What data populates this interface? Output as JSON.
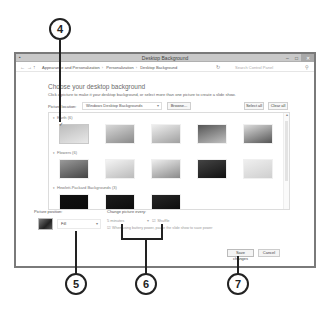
{
  "window": {
    "title": "Desktop Background",
    "controls": [
      "minimize",
      "maximize",
      "close"
    ]
  },
  "nav": {
    "back": "←",
    "forward": "→",
    "up": "↑",
    "breadcrumbs": [
      "Appearance and Personalization",
      "Personalization",
      "Desktop Background"
    ],
    "search_placeholder": "Search Control Panel"
  },
  "content": {
    "title": "Choose your desktop background",
    "subtitle": "Click a picture to make it your desktop background, or select more than one picture to create a slide show.",
    "picture_location_label": "Picture location:",
    "picture_location_value": "Windows Desktop Backgrounds",
    "browse_label": "Browse...",
    "select_all_label": "Select all",
    "clear_all_label": "Clear all"
  },
  "gallery": {
    "groups": [
      {
        "name": "Earth (6)",
        "thumbs": [
          {
            "colors": [
              "#bcbcbc",
              "#e8e8e8"
            ],
            "selected": true
          },
          {
            "colors": [
              "#d8d8d8",
              "#8a8a8a"
            ],
            "selected": false
          },
          {
            "colors": [
              "#eeeeee",
              "#a0a0a0"
            ],
            "selected": false
          },
          {
            "colors": [
              "#555555",
              "#c0c0c0"
            ],
            "selected": false
          },
          {
            "colors": [
              "#dddddd",
              "#555555"
            ],
            "selected": false
          },
          {
            "colors": [
              "#cfcfcf",
              "#8c8c8c"
            ],
            "selected": false
          }
        ]
      },
      {
        "name": "Flowers (6)",
        "thumbs": [
          {
            "colors": [
              "#9a9a9a",
              "#444444"
            ],
            "selected": false
          },
          {
            "colors": [
              "#f4f4f4",
              "#bbbbbb"
            ],
            "selected": false
          },
          {
            "colors": [
              "#eeeeee",
              "#8a8a8a"
            ],
            "selected": false
          },
          {
            "colors": [
              "#444444",
              "#111111"
            ],
            "selected": false
          },
          {
            "colors": [
              "#efefef",
              "#cfcfcf"
            ],
            "selected": false
          },
          {
            "colors": [
              "#e4e4e4",
              "#bdbdbd"
            ],
            "selected": false
          }
        ]
      },
      {
        "name": "Hewlett-Packard Backgrounds (3)",
        "thumbs": [
          {
            "colors": [
              "#111111",
              "#0a0a0a"
            ],
            "selected": false
          },
          {
            "colors": [
              "#1c1c1c",
              "#0a0a0a"
            ],
            "selected": false
          },
          {
            "colors": [
              "#262626",
              "#0a0a0a"
            ],
            "selected": false
          }
        ]
      }
    ]
  },
  "picture_position": {
    "label": "Picture position:",
    "value": "Fill"
  },
  "change_picture": {
    "label": "Change picture every:",
    "interval": "5 minutes",
    "shuffle_label": "Shuffle",
    "battery_label": "When using battery power, pause the slide show to save power"
  },
  "footer": {
    "save_label": "Save changes",
    "cancel_label": "Cancel"
  },
  "callouts": [
    "4",
    "5",
    "6",
    "7"
  ]
}
